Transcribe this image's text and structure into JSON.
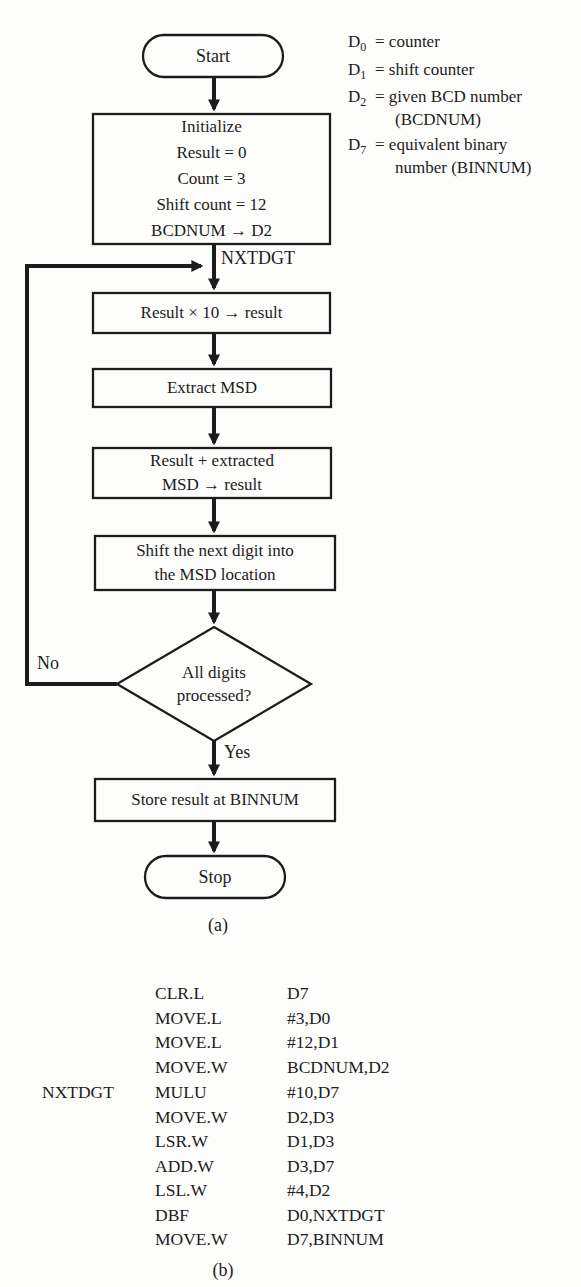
{
  "figure": {
    "part_a_label": "(a)",
    "part_b_label": "(b)"
  },
  "flowchart": {
    "start_label": "Start",
    "initialize": {
      "lines": [
        "Initialize",
        "Result = 0",
        "Count = 3",
        "Shift count = 12",
        "BCDNUM → D2"
      ]
    },
    "nxtdgt_label": "NXTDGT",
    "multiply_label": "Result × 10 → result",
    "extract_label": "Extract MSD",
    "add": {
      "lines": [
        "Result + extracted",
        "MSD → result"
      ]
    },
    "shift": {
      "lines": [
        "Shift the next digit into",
        "the MSD location"
      ]
    },
    "decision": {
      "lines": [
        "All digits",
        "processed?"
      ]
    },
    "no_label": "No",
    "yes_label": "Yes",
    "store_label": "Store result at BINNUM",
    "stop_label": "Stop"
  },
  "legend": {
    "entries": [
      {
        "reg": "D",
        "sub": "0",
        "desc": "= counter",
        "desc2": ""
      },
      {
        "reg": "D",
        "sub": "1",
        "desc": "= shift counter",
        "desc2": ""
      },
      {
        "reg": "D",
        "sub": "2",
        "desc": "= given BCD number",
        "desc2": "(BCDNUM)"
      },
      {
        "reg": "D",
        "sub": "7",
        "desc": "= equivalent binary",
        "desc2": "number (BINNUM)"
      }
    ]
  },
  "code": {
    "rows": [
      {
        "label": "",
        "opcode": "CLR.L",
        "operands": "D7"
      },
      {
        "label": "",
        "opcode": "MOVE.L",
        "operands": "#3,D0"
      },
      {
        "label": "",
        "opcode": "MOVE.L",
        "operands": "#12,D1"
      },
      {
        "label": "",
        "opcode": "MOVE.W",
        "operands": "BCDNUM,D2"
      },
      {
        "label": "NXTDGT",
        "opcode": "MULU",
        "operands": "#10,D7"
      },
      {
        "label": "",
        "opcode": "MOVE.W",
        "operands": "D2,D3"
      },
      {
        "label": "",
        "opcode": "LSR.W",
        "operands": "D1,D3"
      },
      {
        "label": "",
        "opcode": "ADD.W",
        "operands": "D3,D7"
      },
      {
        "label": "",
        "opcode": "LSL.W",
        "operands": "#4,D2"
      },
      {
        "label": "",
        "opcode": "DBF",
        "operands": "D0,NXTDGT"
      },
      {
        "label": "",
        "opcode": "MOVE.W",
        "operands": "D7,BINNUM"
      }
    ]
  },
  "colors": {
    "ink": "#1c1c1c",
    "background": "#fdfdfc"
  }
}
